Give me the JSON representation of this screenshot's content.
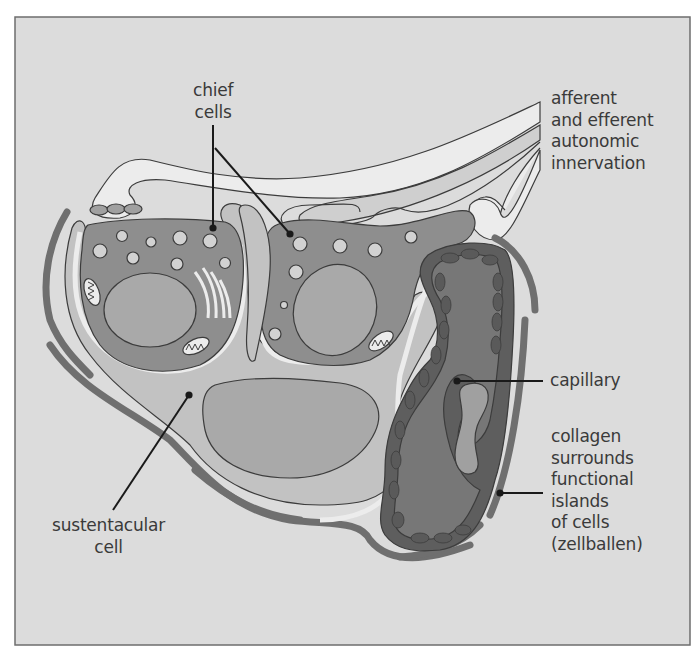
{
  "figure": {
    "colors": {
      "background": "#dcdcdc",
      "frame": "#6e6e6e",
      "outline": "#3c3c3c",
      "light_fill": "#ececec",
      "sustentacular_fill": "#c2c2c2",
      "chief_cytoplasm": "#8e8e8e",
      "nucleus": "#a9a9a9",
      "granule": "#d2d2d2",
      "capillary_lumen": "#777777",
      "endothelium": "#5e5e5e",
      "collagen": "#6f6f6f",
      "leader_line": "#1a1a1a"
    }
  },
  "labels": {
    "chief_cells": [
      "chief",
      "cells"
    ],
    "innervation": [
      "afferent",
      "and efferent",
      "autonomic",
      "innervation"
    ],
    "capillary": [
      "capillary"
    ],
    "collagen": [
      "collagen",
      "surrounds",
      "functional",
      "islands",
      "of cells",
      "(zellballen)"
    ],
    "sustentacular": [
      "sustentacular",
      "cell"
    ]
  },
  "annotations": [
    {
      "id": "chief-cells-leader-1",
      "label": "chief cells",
      "from": [
        213,
        125
      ],
      "to": [
        213,
        228
      ]
    },
    {
      "id": "chief-cells-leader-2",
      "label": "chief cells",
      "from": [
        215,
        148
      ],
      "to": [
        290,
        234
      ]
    },
    {
      "id": "capillary-leader",
      "label": "capillary",
      "from": [
        457,
        381
      ],
      "to": [
        543,
        381
      ]
    },
    {
      "id": "collagen-leader",
      "label": "collagen surrounds functional islands of cells (zellballen)",
      "from": [
        500,
        493
      ],
      "to": [
        543,
        493
      ]
    },
    {
      "id": "sustentacular-leader",
      "label": "sustentacular cell",
      "from": [
        189,
        395
      ],
      "to": [
        113,
        510
      ]
    }
  ]
}
